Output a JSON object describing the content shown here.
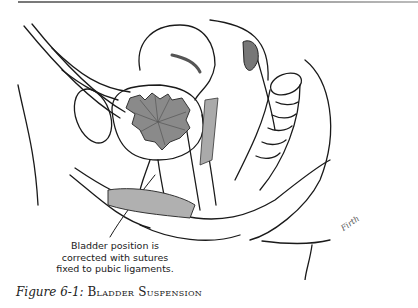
{
  "figure": {
    "number_label": "Figure 6-1:",
    "title": "Bladder Suspension",
    "callout_lines": [
      "Bladder position is",
      "corrected with sutures",
      "fixed to pubic ligaments."
    ],
    "signature": "Firth"
  },
  "colors": {
    "line": "#1a1a1a",
    "bladder_fill": "#8a8a8a",
    "shade_fill": "#9a9a9a",
    "rule": "#888888"
  }
}
